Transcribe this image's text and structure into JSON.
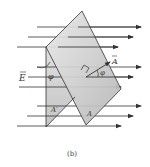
{
  "figure": {
    "caption": "(b)",
    "labels": {
      "field": "E",
      "area_vector": "A",
      "angle_left": "φ",
      "angle_right": "φ",
      "projected_area": "A′",
      "surface_area": "A"
    },
    "colors": {
      "surface_fill": "#c9c9c9",
      "surface_fill_light": "#e6e6e6",
      "lines": "#333333"
    },
    "field_lines": [
      {
        "y": 27,
        "x1": 37,
        "x2": 141
      },
      {
        "y": 37,
        "x1": 28,
        "x2": 133
      },
      {
        "y": 47,
        "x1": 17,
        "x2": 118
      },
      {
        "y": 67,
        "x1": 37,
        "x2": 141
      },
      {
        "y": 77,
        "x1": 28,
        "x2": 133
      },
      {
        "y": 87,
        "x1": 19,
        "x2": 121
      },
      {
        "y": 106,
        "x1": 37,
        "x2": 141
      },
      {
        "y": 116,
        "x1": 27,
        "x2": 133
      },
      {
        "y": 126,
        "x1": 17,
        "x2": 121
      }
    ]
  }
}
